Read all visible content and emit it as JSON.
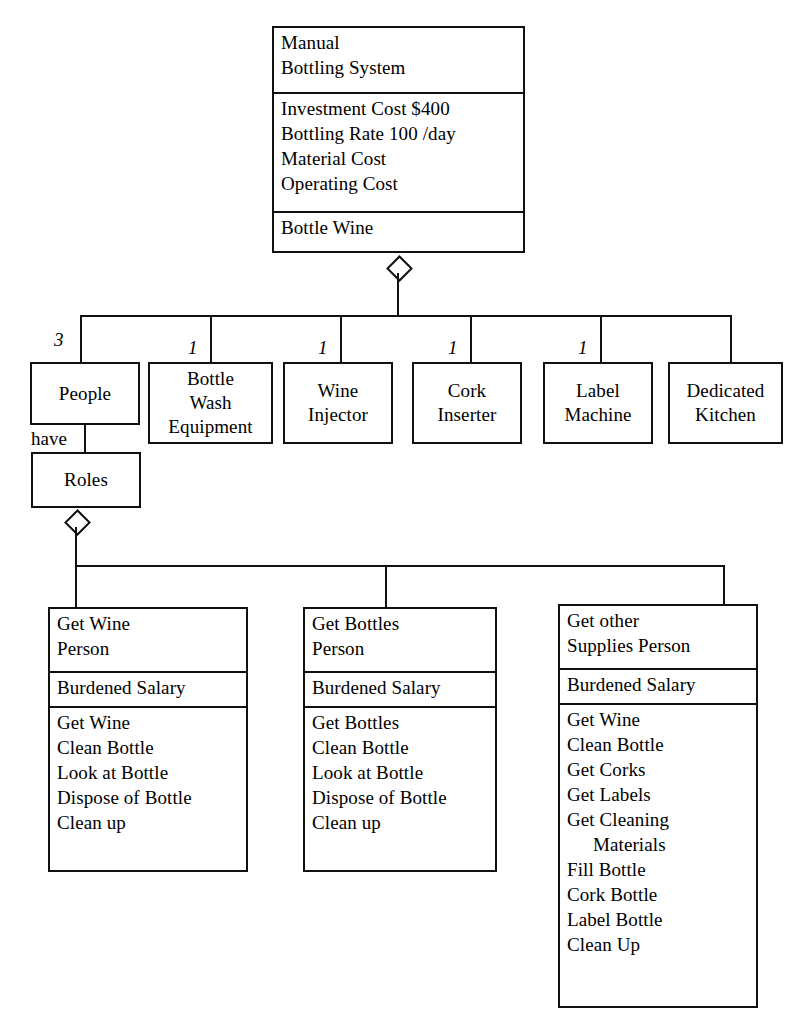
{
  "diagram": {
    "title": "Manual Bottling System",
    "notation": "UML-style class diagram with aggregation (hollow diamond) relationships"
  },
  "root": {
    "name_lines": [
      "Manual",
      "Bottling System"
    ],
    "attributes": [
      "Investment Cost $400",
      "Bottling Rate 100 /day",
      "Material Cost",
      "Operating Cost"
    ],
    "operations": [
      "Bottle Wine"
    ]
  },
  "parts": [
    {
      "name_lines": [
        "People"
      ],
      "multiplicity": "3"
    },
    {
      "name_lines": [
        "Bottle",
        "Wash",
        "Equipment"
      ],
      "multiplicity": "1"
    },
    {
      "name_lines": [
        "Wine",
        "Injector"
      ],
      "multiplicity": "1"
    },
    {
      "name_lines": [
        "Cork",
        "Inserter"
      ],
      "multiplicity": "1"
    },
    {
      "name_lines": [
        "Label",
        "Machine"
      ],
      "multiplicity": "1"
    },
    {
      "name_lines": [
        "Dedicated",
        "Kitchen"
      ],
      "multiplicity": ""
    }
  ],
  "roles_link": {
    "label": "have",
    "box_name": "Roles"
  },
  "roles": [
    {
      "name_lines": [
        "Get Wine",
        "Person"
      ],
      "attributes": [
        "Burdened Salary"
      ],
      "operations": [
        "Get Wine",
        "Clean Bottle",
        "Look at Bottle",
        "Dispose of Bottle",
        "Clean up"
      ]
    },
    {
      "name_lines": [
        "Get Bottles",
        "Person"
      ],
      "attributes": [
        "Burdened Salary"
      ],
      "operations": [
        "Get Bottles",
        "Clean Bottle",
        "Look at Bottle",
        "Dispose of Bottle",
        "Clean up"
      ]
    },
    {
      "name_lines": [
        "Get other",
        "Supplies Person"
      ],
      "attributes": [
        "Burdened Salary"
      ],
      "operations": [
        "Get Wine",
        "Clean Bottle",
        "Get Corks",
        "Get Labels",
        "Get Cleaning",
        "Materials",
        "Fill Bottle",
        "Cork Bottle",
        "Label Bottle",
        "Clean Up"
      ]
    }
  ],
  "colors": {
    "stroke": "#111111",
    "background": "#ffffff"
  }
}
